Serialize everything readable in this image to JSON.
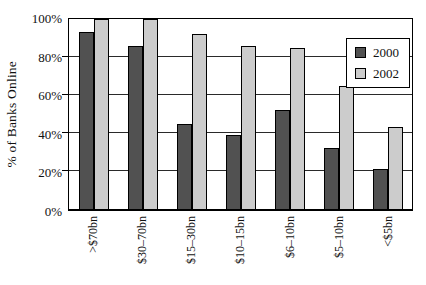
{
  "chart_data": {
    "type": "bar",
    "title": "",
    "ylabel": "% of Banks Online",
    "xlabel": "",
    "categories": [
      ">$70bn",
      "$30–70bn",
      "$15–30bn",
      "$10–15bn",
      "$6–10bn",
      "$5–10bn",
      "<$5bn"
    ],
    "series": [
      {
        "name": "2000",
        "color": "#515151",
        "values": [
          93,
          86,
          45,
          39,
          52,
          32,
          21
        ]
      },
      {
        "name": "2002",
        "color": "#cccccc",
        "values": [
          100,
          100,
          92,
          86,
          85,
          65,
          43
        ]
      }
    ],
    "ylim": [
      0,
      100
    ],
    "yticks": [
      "0%",
      "20%",
      "40%",
      "60%",
      "80%",
      "100%"
    ],
    "grid": true,
    "legend": {
      "position": "top-right",
      "entries": [
        "2000",
        "2002"
      ]
    }
  },
  "colors": {
    "background": "#ffffff",
    "plot_border": "#000000",
    "gridline": "#2a2a2a",
    "bar_2000": "#515151",
    "bar_2002": "#cccccc",
    "text": "#111111"
  }
}
